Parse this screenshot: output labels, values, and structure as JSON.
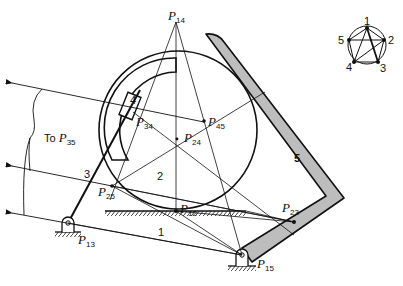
{
  "figure": {
    "type": "kinematic-instant-center-diagram",
    "links": [
      {
        "id": "1",
        "label": "1",
        "role": "ground"
      },
      {
        "id": "2",
        "label": "2",
        "role": "rolling disk"
      },
      {
        "id": "3",
        "label": "3",
        "role": "crank with slider"
      },
      {
        "id": "4",
        "label": "4",
        "role": "slider block"
      },
      {
        "id": "5",
        "label": "5",
        "role": "bent follower arm"
      }
    ],
    "instant_centers": [
      {
        "id": "P14",
        "base": "P",
        "sub": "14"
      },
      {
        "id": "P34",
        "base": "P",
        "sub": "34"
      },
      {
        "id": "P45",
        "base": "P",
        "sub": "45"
      },
      {
        "id": "P24",
        "base": "P",
        "sub": "24"
      },
      {
        "id": "P25",
        "base": "P",
        "sub": "25"
      },
      {
        "id": "P12",
        "base": "P",
        "sub": "12"
      },
      {
        "id": "P23",
        "base": "P",
        "sub": "23"
      },
      {
        "id": "P13",
        "base": "P",
        "sub": "13"
      },
      {
        "id": "P15",
        "base": "P",
        "sub": "15"
      }
    ],
    "annotation": {
      "prefix": "To ",
      "base": "P",
      "sub": "35"
    },
    "polygon_diagram": {
      "vertices": [
        "1",
        "2",
        "3",
        "4",
        "5"
      ]
    }
  }
}
